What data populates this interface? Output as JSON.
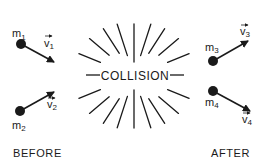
{
  "center_label": "COLLISION",
  "before": {
    "caption": "BEFORE",
    "particles": [
      {
        "mass": "m",
        "mass_sub": "1",
        "velocity": "v",
        "velocity_sub": "1"
      },
      {
        "mass": "m",
        "mass_sub": "2",
        "velocity": "v",
        "velocity_sub": "2"
      }
    ]
  },
  "after": {
    "caption": "AFTER",
    "particles": [
      {
        "mass": "m",
        "mass_sub": "3",
        "velocity": "v",
        "velocity_sub": "3"
      },
      {
        "mass": "m",
        "mass_sub": "4",
        "velocity": "v",
        "velocity_sub": "4"
      }
    ]
  },
  "colors": {
    "ink": "#1a1a1a",
    "background": "#ffffff"
  }
}
